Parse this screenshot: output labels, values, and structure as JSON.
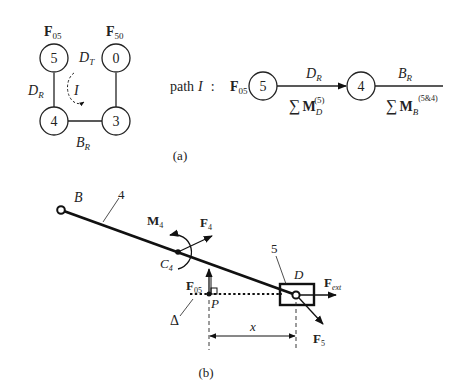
{
  "panel_a": {
    "caption": "(a)",
    "graph": {
      "nodes": [
        {
          "id": "5",
          "label": "5",
          "force_label": "F",
          "force_sub": "05"
        },
        {
          "id": "0",
          "label": "0",
          "force_label": "F",
          "force_sub": "50"
        },
        {
          "id": "4",
          "label": "4"
        },
        {
          "id": "3",
          "label": "3"
        }
      ],
      "edges": [
        {
          "from": "5",
          "to": "4",
          "label": "D",
          "sub": "R"
        },
        {
          "from": "4",
          "to": "3",
          "label": "B",
          "sub": "R"
        },
        {
          "from": "3",
          "to": "0",
          "label": "",
          "sub": ""
        },
        {
          "between": "5-0",
          "label": "D",
          "sub": "T"
        }
      ],
      "loop_label": "I"
    },
    "path": {
      "prefix": "path",
      "name": "I",
      "colon": ":",
      "start_force": "F",
      "start_force_sub": "05",
      "node1": "5",
      "edge1_label": "D",
      "edge1_sub": "R",
      "edge1_sum": "∑",
      "edge1_sum_sym": "M",
      "edge1_sum_sub": "D",
      "edge1_sum_sup": "(5)",
      "node2": "4",
      "edge2_label": "B",
      "edge2_sub": "R",
      "edge2_sum": "∑",
      "edge2_sum_sym": "M",
      "edge2_sum_sub": "B",
      "edge2_sum_sup": "(5&4)"
    }
  },
  "panel_b": {
    "caption": "(b)",
    "labels": {
      "B": "B",
      "link4": "4",
      "M4": "M",
      "M4_sub": "4",
      "F4": "F",
      "F4_sub": "4",
      "C4": "C",
      "C4_sub": "4",
      "slider5": "5",
      "D": "D",
      "Fext": "F",
      "Fext_sub": "ext",
      "F05": "F",
      "F05_sub": "05",
      "P": "P",
      "Delta": "Δ",
      "x": "x",
      "F5": "F",
      "F5_sub": "5"
    }
  }
}
